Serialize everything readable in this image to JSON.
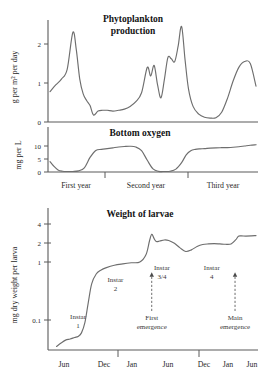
{
  "figure": {
    "title_panel1": "Phytoplankton production",
    "title_panel1_line1": "Phytoplankton",
    "title_panel1_line2": "production",
    "title_panel2": "Bottom oxygen",
    "title_panel3": "Weight of larvae"
  },
  "chart_data": [
    {
      "type": "line",
      "title": "Phytoplankton production",
      "ylabel": "g per m² per day",
      "xlabel": "",
      "yticks": [
        0,
        1,
        2
      ],
      "ytick_labels": [
        "0",
        "1",
        "2"
      ],
      "ylim": [
        0,
        2.6
      ],
      "xlim": [
        0,
        36
      ],
      "grid": false,
      "x": [
        0,
        1,
        2,
        3,
        4,
        4.6,
        5.2,
        5.8,
        6.4,
        7,
        7.6,
        8.4,
        9.2,
        10,
        11,
        12,
        13,
        14,
        15,
        16,
        17,
        17.6,
        18.2,
        18.8,
        19.4,
        20,
        20.6,
        21.2,
        21.8,
        22.4,
        23,
        23.6,
        24.2,
        25,
        26,
        27,
        28,
        29,
        30,
        31,
        32,
        33,
        34,
        35,
        36
      ],
      "y": [
        0.78,
        0.95,
        1.1,
        1.35,
        2.3,
        1.85,
        1.1,
        0.72,
        0.55,
        0.42,
        0.18,
        0.28,
        0.3,
        0.3,
        0.28,
        0.3,
        0.33,
        0.4,
        0.52,
        0.75,
        1.4,
        1.18,
        1.45,
        0.95,
        0.62,
        1.1,
        1.65,
        1.62,
        1.55,
        1.95,
        2.45,
        1.6,
        0.85,
        0.4,
        0.2,
        0.12,
        0.1,
        0.11,
        0.25,
        0.6,
        1.05,
        1.4,
        1.55,
        1.5,
        0.92
      ]
    },
    {
      "type": "line",
      "title": "Bottom oxygen",
      "ylabel": "mg per L",
      "xlabel": "",
      "yticks": [
        0,
        5,
        10
      ],
      "ytick_labels": [
        "0",
        "5",
        "10"
      ],
      "ylim": [
        0,
        12
      ],
      "xlim": [
        0,
        36
      ],
      "grid": false,
      "xtick_labels": [
        "First year",
        "Second year",
        "Third year"
      ],
      "x": [
        0,
        0.6,
        1.4,
        2.2,
        3,
        4,
        5,
        6,
        7,
        8,
        9,
        10,
        11,
        12,
        13,
        14,
        15,
        16,
        17,
        18,
        19,
        20,
        21,
        22,
        23,
        23.8,
        24.6,
        25.4,
        26.2,
        27,
        28,
        29,
        30,
        31,
        32,
        33,
        34,
        35,
        36
      ],
      "y": [
        4.0,
        2.4,
        0.8,
        0.3,
        0.2,
        0.2,
        0.45,
        1.6,
        5.6,
        8.3,
        8.7,
        9.0,
        9.3,
        9.6,
        9.8,
        9.9,
        9.6,
        8.2,
        4.5,
        1.2,
        0.25,
        0.2,
        0.3,
        1.1,
        3.6,
        6.6,
        8.2,
        8.7,
        8.9,
        9.0,
        9.2,
        9.3,
        9.35,
        9.4,
        9.5,
        9.7,
        10.0,
        10.3,
        10.5
      ]
    },
    {
      "type": "line",
      "title": "Weight of larvae",
      "ylabel": "mg dry weight per larva",
      "xlabel": "",
      "yscale": "log",
      "yticks": [
        0.1,
        1,
        2,
        4
      ],
      "ytick_labels": [
        "0.1",
        "1",
        "2",
        "4"
      ],
      "ylim": [
        0.02,
        6
      ],
      "xlim": [
        0,
        36
      ],
      "grid": false,
      "xtick_labels": [
        "Jun",
        "Dec",
        "Jan",
        "Jun",
        "Dec",
        "Jan",
        "Jun"
      ],
      "x": [
        0.8,
        1.6,
        2.4,
        3.2,
        4.0,
        4.6,
        5.2,
        5.8,
        6.4,
        7.0,
        7.8,
        8.6,
        9.6,
        11,
        12.5,
        14,
        15.5,
        16.6,
        17.2,
        17.6,
        18.0,
        18.4,
        19.0,
        19.8,
        20.6,
        21.6,
        22.6,
        23.6,
        24.6,
        25.6,
        26.6,
        27.6,
        28.6,
        29.6,
        30.6,
        31.6,
        32.4,
        32.9,
        33.4,
        34.2,
        35.2,
        36
      ],
      "y": [
        0.035,
        0.04,
        0.045,
        0.047,
        0.05,
        0.052,
        0.06,
        0.09,
        0.2,
        0.42,
        0.62,
        0.72,
        0.8,
        0.88,
        0.93,
        0.97,
        1.0,
        1.35,
        2.3,
        3.0,
        2.55,
        2.25,
        2.3,
        2.4,
        2.35,
        2.1,
        1.75,
        1.52,
        1.62,
        1.85,
        2.0,
        2.05,
        2.07,
        2.05,
        2.02,
        2.05,
        2.4,
        2.78,
        2.82,
        2.8,
        2.82,
        2.85
      ],
      "annotations": [
        {
          "label": "Instar 1",
          "line1": "Instar",
          "line2": "1",
          "x": 4.6,
          "y_text": 0.105
        },
        {
          "label": "Instar 2",
          "line1": "Instar",
          "line2": "2",
          "x": 11.2,
          "y_text": 0.46
        },
        {
          "label": "Instar 3/4",
          "line1": "Instar",
          "line2": "3/4",
          "x": 19.4,
          "y_text": 0.72
        },
        {
          "label": "Instar 4",
          "line1": "Instar",
          "line2": "4",
          "x": 28.2,
          "y_text": 0.72
        },
        {
          "label": "First emergence",
          "line1": "First",
          "line2": "emergence",
          "x": 17.6,
          "y_text": 0.1,
          "arrow": true
        },
        {
          "label": "Main emergence",
          "line1": "Main",
          "line2": "emergence",
          "x": 32.3,
          "y_text": 0.1,
          "arrow": true
        }
      ]
    }
  ]
}
